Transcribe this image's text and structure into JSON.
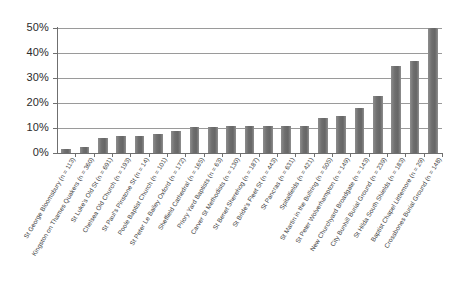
{
  "chart_data": {
    "type": "bar",
    "title": "",
    "subtitle": "",
    "xlabel": "",
    "ylabel": "",
    "ylim": [
      0,
      50
    ],
    "ytick_labels": [
      "0%",
      "10%",
      "20%",
      "30%",
      "40%",
      "50%"
    ],
    "ytick_values": [
      0,
      10,
      20,
      30,
      40,
      50
    ],
    "grid": true,
    "legend": false,
    "legend_position": "none",
    "bar_color": "#6e6e6e",
    "categories": [
      "St George Bloomsbury (n = 113)",
      "Kingston on Thames Quakers (n = 360)",
      "St Luke's Old St (n = 691)",
      "Chelsea Old Church (n = 193)",
      "St Paul's Pinstone St (n = 14)",
      "Poole Baptist Church (n = 101)",
      "St Peter Le Bailey Oxford (n = 172)",
      "Sheffield Cathedral (n = 165)",
      "Priory Yard Baptists (n = 63)",
      "Carver St Methodists (n = 130)",
      "St Benet Sherehog (n = 187)",
      "St Bride's Fleet St (n = 443)",
      "St Pancras (n = 631)",
      "Spitalfields (n = 421)",
      "St Martin in the Bullring (n = 505)",
      "St Peter Wolverhampton (n = 149)",
      "New Churchyard Broadgate (n = 143)",
      "City Bunhill Burial Ground (n = 239)",
      "St Hilda South Shields (n = 183)",
      "Baptist Chapel Littlemore (n = 29)",
      "Crossbones Burial Ground (n = 148)"
    ],
    "values": [
      1.5,
      2.5,
      6.0,
      6.8,
      6.8,
      7.7,
      8.7,
      10.3,
      10.3,
      11.0,
      11.0,
      11.0,
      11.0,
      11.0,
      14.0,
      15.0,
      18.0,
      23.0,
      35.0,
      37.0,
      50.0
    ],
    "series": [
      {
        "name": "",
        "values": [
          1.5,
          2.5,
          6.0,
          6.8,
          6.8,
          7.7,
          8.7,
          10.3,
          10.3,
          11.0,
          11.0,
          11.0,
          11.0,
          11.0,
          14.0,
          15.0,
          18.0,
          23.0,
          35.0,
          37.0,
          50.0
        ]
      }
    ]
  }
}
